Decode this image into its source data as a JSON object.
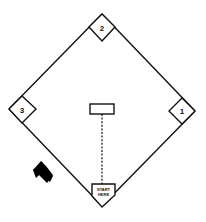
{
  "diagram": {
    "title": "",
    "colors": {
      "line": "#111111",
      "fill": "#ffffff",
      "arrow": "#000000"
    },
    "bases": [
      {
        "id": "first",
        "label": "1"
      },
      {
        "id": "second",
        "label": "2"
      },
      {
        "id": "third",
        "label": "3"
      }
    ],
    "home_plate": {
      "label_line1": "START",
      "label_line2": "HERE"
    },
    "pitchers_mound": {
      "label": ""
    },
    "arrow": {
      "direction": "up-left",
      "icon": "arrow-up-left-icon"
    }
  }
}
